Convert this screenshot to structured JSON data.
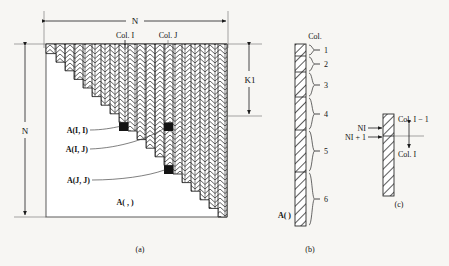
{
  "figure": {
    "title_caption_a": "(a)",
    "title_caption_b": "(b)",
    "title_caption_c": "(c)"
  },
  "panel_a": {
    "dim_top_label": "N",
    "dim_left_label": "N",
    "dim_right_label": "K1",
    "col_i_label": "Col. I",
    "col_j_label": "Col. J",
    "callouts": [
      {
        "name": "a-i-i",
        "text": "A(I, I)"
      },
      {
        "name": "a-i-j",
        "text": "A(I, J)"
      },
      {
        "name": "a-j-j",
        "text": "A(J, J)"
      }
    ],
    "matrix_label": "A( , )",
    "caption": "(a)",
    "steps": 20
  },
  "panel_b": {
    "header_label": "Col.",
    "array_label": "A( )",
    "segment_numbers": [
      "1",
      "2",
      "3",
      "4",
      "5",
      "6"
    ],
    "caption": "(b)"
  },
  "panel_c": {
    "ni_label": "NI",
    "ni_plus_one_label": "NI + 1",
    "col_above_label": "Col. I − 1",
    "col_below_label": "Col. I",
    "caption": "(c)"
  },
  "colors": {
    "background": "#f7f6f3",
    "ink": "#1a1a1a",
    "rule": "#4a4a4a",
    "hatch": "#2b2b2b"
  }
}
